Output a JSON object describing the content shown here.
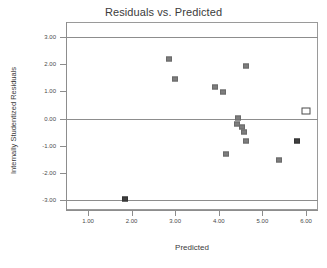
{
  "chart_data": {
    "type": "scatter",
    "title": "Residuals vs. Predicted",
    "xlabel": "Predicted",
    "ylabel": "Internally Studentized Residuals",
    "xlim": [
      0.6,
      6.3
    ],
    "ylim": [
      -3.4,
      3.4
    ],
    "grid": false,
    "legend": null,
    "xticks": [
      "1.00",
      "2.00",
      "3.00",
      "4.00",
      "5.00",
      "6.00"
    ],
    "xtick_values": [
      1.0,
      2.0,
      3.0,
      4.0,
      5.0,
      6.0
    ],
    "yticks": [
      "3.00",
      "2.00",
      "1.00",
      "0.00",
      "-1.00",
      "-2.00",
      "-3.00"
    ],
    "ytick_values": [
      3.0,
      2.0,
      1.0,
      0.0,
      -1.0,
      -2.0,
      -3.0
    ],
    "reference_lines": [
      {
        "name": "upper-limit",
        "y": 3.0
      },
      {
        "name": "zero-line",
        "y": 0.0
      },
      {
        "name": "lower-limit",
        "y": -3.0
      }
    ],
    "points": [
      {
        "x": 1.86,
        "y": -2.95,
        "style": "dark"
      },
      {
        "x": 2.85,
        "y": 2.2,
        "style": "filled"
      },
      {
        "x": 3.0,
        "y": 1.47,
        "style": "filled"
      },
      {
        "x": 3.92,
        "y": 1.17,
        "style": "filled"
      },
      {
        "x": 4.1,
        "y": 0.99,
        "style": "filled"
      },
      {
        "x": 4.63,
        "y": 1.94,
        "style": "filled"
      },
      {
        "x": 4.16,
        "y": -1.3,
        "style": "filled"
      },
      {
        "x": 4.44,
        "y": 0.01,
        "style": "filled"
      },
      {
        "x": 4.42,
        "y": -0.2,
        "style": "filled"
      },
      {
        "x": 4.53,
        "y": -0.33,
        "style": "filled"
      },
      {
        "x": 4.58,
        "y": -0.51,
        "style": "filled"
      },
      {
        "x": 4.62,
        "y": -0.81,
        "style": "filled"
      },
      {
        "x": 5.38,
        "y": -1.53,
        "style": "filled"
      },
      {
        "x": 5.79,
        "y": -0.82,
        "style": "dark"
      },
      {
        "x": 5.99,
        "y": 0.28,
        "style": "open"
      }
    ],
    "colors": {
      "marker": "#7d7d7d",
      "marker_dark": "#3f3f3f",
      "marker_open_border": "#4a4a4a",
      "axis": "#8d8d8d",
      "text": "#3b3b3b",
      "background": "#ffffff"
    }
  }
}
